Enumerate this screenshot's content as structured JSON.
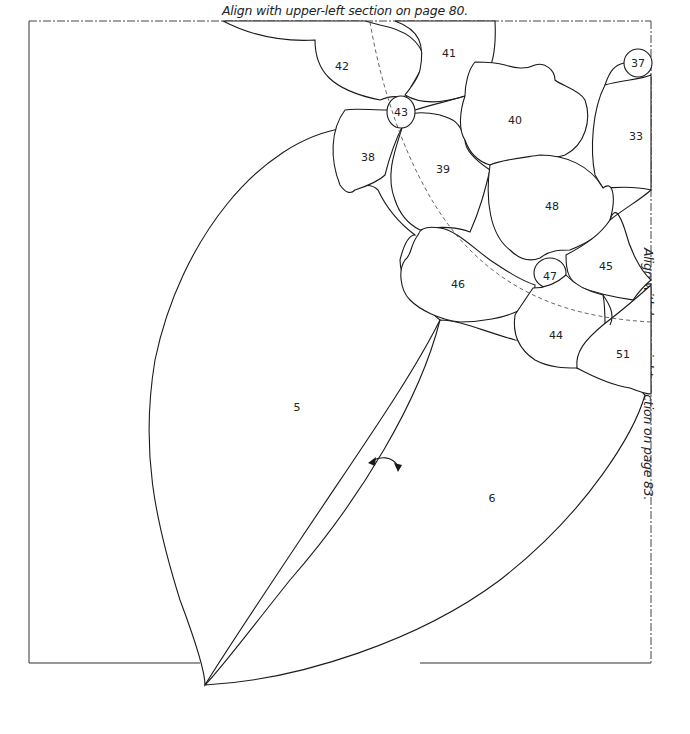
{
  "captions": {
    "top": "Align with upper-left section on page 80.",
    "right": "Align with lower-right section on page 83."
  },
  "pieces": [
    {
      "id": "42",
      "label": "42"
    },
    {
      "id": "41",
      "label": "41"
    },
    {
      "id": "37",
      "label": "37"
    },
    {
      "id": "43",
      "label": "43"
    },
    {
      "id": "40",
      "label": "40"
    },
    {
      "id": "33",
      "label": "33"
    },
    {
      "id": "38",
      "label": "38"
    },
    {
      "id": "39",
      "label": "39"
    },
    {
      "id": "48",
      "label": "48"
    },
    {
      "id": "47",
      "label": "47"
    },
    {
      "id": "45",
      "label": "45"
    },
    {
      "id": "46",
      "label": "46"
    },
    {
      "id": "44",
      "label": "44"
    },
    {
      "id": "51",
      "label": "51"
    },
    {
      "id": "5",
      "label": "5"
    },
    {
      "id": "6",
      "label": "6"
    }
  ],
  "icons": {
    "fold_arrow": "double-curved-arrow-icon"
  },
  "colors": {
    "line": "#1a1a1a",
    "background": "#ffffff"
  }
}
